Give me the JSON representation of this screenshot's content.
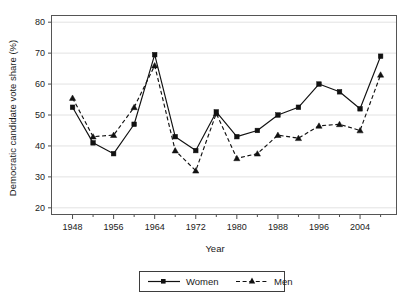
{
  "chart_data": {
    "type": "line",
    "title": "",
    "subtitle": "",
    "xlabel": "Year",
    "ylabel": "Democratic candidate vote share (%)",
    "x": [
      1948,
      1952,
      1956,
      1960,
      1964,
      1968,
      1972,
      1976,
      1980,
      1984,
      1988,
      1992,
      1996,
      2000,
      2004,
      2008
    ],
    "xtick_labels": [
      "1948",
      "1956",
      "1964",
      "1972",
      "1980",
      "1988",
      "1996",
      "2004"
    ],
    "xtick_values": [
      1948,
      1956,
      1964,
      1972,
      1980,
      1988,
      1996,
      2004
    ],
    "xminor_values": [
      1952,
      1960,
      1968,
      1976,
      1984,
      1992,
      2000,
      2008
    ],
    "xlim": [
      1944,
      2011
    ],
    "ytick_labels": [
      "20",
      "30",
      "40",
      "50",
      "60",
      "70",
      "80"
    ],
    "ytick_values": [
      20,
      30,
      40,
      50,
      60,
      70,
      80
    ],
    "ylim": [
      18,
      82
    ],
    "grid": "horizontal",
    "legend_position": "bottom-center",
    "series": [
      {
        "name": "Women",
        "line_style": "solid",
        "marker": "square",
        "color": "#111111",
        "values": [
          52.5,
          41.0,
          37.5,
          47.0,
          69.5,
          43.0,
          38.5,
          51.0,
          43.0,
          45.0,
          50.0,
          52.5,
          60.0,
          57.5,
          52.0,
          69.0
        ]
      },
      {
        "name": "Men",
        "line_style": "dashed",
        "marker": "triangle",
        "color": "#111111",
        "values": [
          55.5,
          43.0,
          43.5,
          52.5,
          66.0,
          38.5,
          32.0,
          50.5,
          36.0,
          37.5,
          43.5,
          42.5,
          46.5,
          47.0,
          45.0,
          63.0
        ]
      }
    ]
  },
  "legend": {
    "entries": [
      {
        "label": "Women"
      },
      {
        "label": "Men"
      }
    ]
  }
}
